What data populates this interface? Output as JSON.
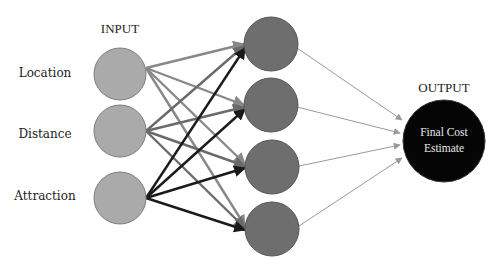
{
  "diagram": {
    "type": "neural-network",
    "input_header": "INPUT",
    "output_header": "OUTPUT",
    "colors": {
      "background": "#ffffff",
      "input_fill": "#aaaaaa",
      "hidden_fill": "#6e6e6e",
      "output_fill": "#050505",
      "node_stroke": "#7a7a7a",
      "edge_location": "#888888",
      "edge_distance": "#6a6a6a",
      "edge_attraction": "#1a1a1a",
      "edge_output": "#9a9a9a"
    },
    "input_nodes": [
      {
        "label": "Location"
      },
      {
        "label": "Distance"
      },
      {
        "label": "Attraction"
      }
    ],
    "hidden_nodes": [
      {
        "id": "h1"
      },
      {
        "id": "h2"
      },
      {
        "id": "h3"
      },
      {
        "id": "h4"
      }
    ],
    "output_node": {
      "line1": "Final Cost",
      "line2": "Estimate"
    },
    "connections": "fully-connected input(3) -> hidden(4) -> output(1)"
  }
}
